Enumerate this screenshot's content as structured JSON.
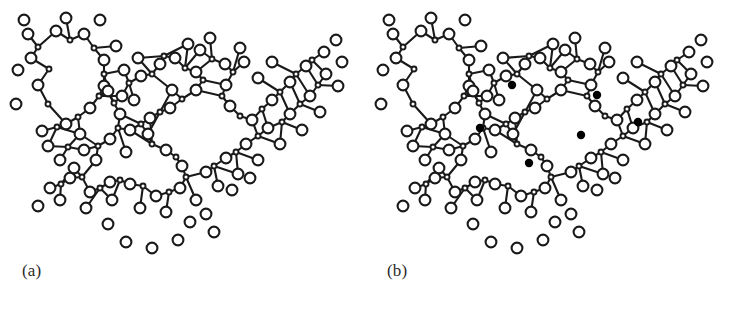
{
  "figure": {
    "kind": "structure-diagram",
    "background_color": "#ffffff",
    "width": 730,
    "height": 313
  },
  "style": {
    "bond_color": "#1a1a1a",
    "bond_width": 2.1,
    "oxygen_fill": "#ffffff",
    "oxygen_stroke": "#1a1a1a",
    "oxygen_stroke_width": 2.1,
    "oxygen_radius": 5.4,
    "silicon_fill": "#ffffff",
    "silicon_stroke": "#1a1a1a",
    "silicon_stroke_width": 1.9,
    "silicon_radius": 2.5,
    "modifier_fill": "#000000",
    "modifier_radius": 4.2,
    "label_color": "#2b2b2b"
  },
  "panels": [
    {
      "id": "a",
      "label": "(a)",
      "has_modifiers": false
    },
    {
      "id": "b",
      "label": "(b)",
      "has_modifiers": true
    }
  ],
  "chart_data": {
    "type": "scatter",
    "title": "",
    "xlabel": "",
    "ylabel": "",
    "legend_position": "none",
    "grid": false,
    "panel_a_label": "(a)",
    "panel_b_label": "(b)",
    "atom_counts": {
      "panel_a_oxygen": 96,
      "panel_a_silicon": 44,
      "panel_b_oxygen": 96,
      "panel_b_silicon": 44,
      "panel_b_modifier_cations": 6
    },
    "modifier_positions": [
      [
        147,
        85
      ],
      [
        115,
        128
      ],
      [
        164,
        163
      ],
      [
        216,
        135
      ],
      [
        232,
        95
      ],
      [
        273,
        122
      ]
    ],
    "silicon": [
      [
        49,
        69
      ],
      [
        48,
        104
      ],
      [
        38,
        47
      ],
      [
        70,
        40
      ],
      [
        94,
        48
      ],
      [
        104,
        74
      ],
      [
        99,
        96
      ],
      [
        78,
        117
      ],
      [
        57,
        127
      ],
      [
        68,
        147
      ],
      [
        98,
        146
      ],
      [
        118,
        128
      ],
      [
        114,
        103
      ],
      [
        129,
        83
      ],
      [
        152,
        74
      ],
      [
        164,
        56
      ],
      [
        185,
        68
      ],
      [
        203,
        80
      ],
      [
        182,
        99
      ],
      [
        160,
        112
      ],
      [
        141,
        124
      ],
      [
        152,
        144
      ],
      [
        176,
        157
      ],
      [
        186,
        177
      ],
      [
        169,
        192
      ],
      [
        143,
        186
      ],
      [
        120,
        180
      ],
      [
        100,
        188
      ],
      [
        82,
        177
      ],
      [
        61,
        184
      ],
      [
        212,
        59
      ],
      [
        233,
        72
      ],
      [
        222,
        96
      ],
      [
        240,
        116
      ],
      [
        262,
        109
      ],
      [
        280,
        92
      ],
      [
        296,
        74
      ],
      [
        312,
        60
      ],
      [
        318,
        85
      ],
      [
        300,
        104
      ],
      [
        282,
        122
      ],
      [
        258,
        136
      ],
      [
        236,
        152
      ],
      [
        214,
        166
      ]
    ],
    "oxygen": [
      [
        31,
        58
      ],
      [
        38,
        85
      ],
      [
        28,
        34
      ],
      [
        56,
        31
      ],
      [
        84,
        34
      ],
      [
        104,
        60
      ],
      [
        104,
        86
      ],
      [
        90,
        108
      ],
      [
        66,
        124
      ],
      [
        42,
        131
      ],
      [
        60,
        160
      ],
      [
        84,
        150
      ],
      [
        110,
        139
      ],
      [
        120,
        114
      ],
      [
        108,
        91
      ],
      [
        124,
        70
      ],
      [
        141,
        76
      ],
      [
        160,
        64
      ],
      [
        175,
        58
      ],
      [
        196,
        72
      ],
      [
        196,
        90
      ],
      [
        172,
        90
      ],
      [
        170,
        108
      ],
      [
        150,
        118
      ],
      [
        130,
        130
      ],
      [
        148,
        134
      ],
      [
        166,
        150
      ],
      [
        182,
        166
      ],
      [
        180,
        188
      ],
      [
        156,
        196
      ],
      [
        130,
        184
      ],
      [
        110,
        182
      ],
      [
        90,
        192
      ],
      [
        70,
        178
      ],
      [
        50,
        188
      ],
      [
        200,
        50
      ],
      [
        225,
        64
      ],
      [
        244,
        62
      ],
      [
        226,
        85
      ],
      [
        230,
        106
      ],
      [
        252,
        120
      ],
      [
        272,
        100
      ],
      [
        290,
        82
      ],
      [
        306,
        66
      ],
      [
        324,
        52
      ],
      [
        326,
        74
      ],
      [
        310,
        96
      ],
      [
        290,
        114
      ],
      [
        268,
        128
      ],
      [
        246,
        144
      ],
      [
        226,
        158
      ],
      [
        206,
        172
      ],
      [
        18,
        70
      ],
      [
        16,
        104
      ],
      [
        24,
        20
      ],
      [
        66,
        18
      ],
      [
        100,
        20
      ],
      [
        116,
        46
      ],
      [
        122,
        96
      ],
      [
        80,
        134
      ],
      [
        48,
        146
      ],
      [
        74,
        168
      ],
      [
        96,
        160
      ],
      [
        126,
        152
      ],
      [
        134,
        100
      ],
      [
        138,
        58
      ],
      [
        188,
        44
      ],
      [
        210,
        38
      ],
      [
        240,
        48
      ],
      [
        258,
        78
      ],
      [
        272,
        62
      ],
      [
        336,
        40
      ],
      [
        342,
        62
      ],
      [
        338,
        86
      ],
      [
        320,
        112
      ],
      [
        302,
        130
      ],
      [
        280,
        144
      ],
      [
        258,
        160
      ],
      [
        238,
        174
      ],
      [
        218,
        186
      ],
      [
        196,
        200
      ],
      [
        60,
        200
      ],
      [
        38,
        206
      ],
      [
        86,
        208
      ],
      [
        112,
        200
      ],
      [
        140,
        208
      ],
      [
        166,
        212
      ],
      [
        190,
        222
      ],
      [
        178,
        240
      ],
      [
        152,
        248
      ],
      [
        126,
        242
      ],
      [
        108,
        224
      ],
      [
        206,
        214
      ],
      [
        214,
        232
      ],
      [
        232,
        190
      ],
      [
        250,
        178
      ]
    ]
  }
}
